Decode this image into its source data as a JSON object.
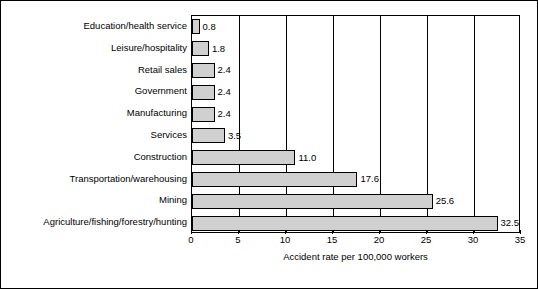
{
  "chart_data": {
    "type": "bar",
    "orientation": "horizontal",
    "title": "",
    "xlabel": "Accident rate per 100,000 workers",
    "ylabel": "",
    "xlim": [
      0,
      35
    ],
    "xticks": [
      0,
      5,
      10,
      15,
      20,
      25,
      30,
      35
    ],
    "grid": true,
    "grid_axis": "x",
    "legend": false,
    "bar_color": "#d0d0d0",
    "bar_edge_color": "#000000",
    "categories": [
      "Education/health service",
      "Leisure/hospitality",
      "Retail sales",
      "Government",
      "Manufacturing",
      "Services",
      "Construction",
      "Transportation/warehousing",
      "Mining",
      "Agriculture/fishing/forestry/hunting"
    ],
    "values": [
      0.8,
      1.8,
      2.4,
      2.4,
      2.4,
      3.5,
      11.0,
      17.6,
      25.6,
      32.5
    ],
    "value_labels": [
      "0.8",
      "1.8",
      "2.4",
      "2.4",
      "2.4",
      "3.5",
      "11.0",
      "17.6",
      "25.6",
      "32.5"
    ],
    "xtick_labels": [
      "0",
      "5",
      "10",
      "15",
      "20",
      "25",
      "30",
      "35"
    ]
  }
}
